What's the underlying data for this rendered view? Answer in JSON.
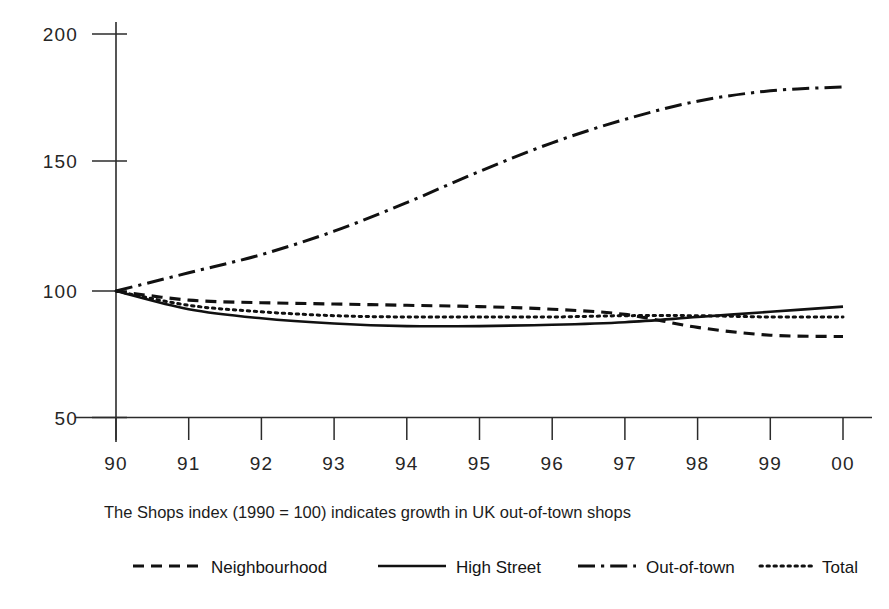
{
  "chart_data": {
    "type": "line",
    "title": "",
    "subtitle": "",
    "caption": "The Shops index (1990 = 100) indicates growth in UK out-of-town shops",
    "xlabel": "",
    "ylabel": "",
    "x": [
      "90",
      "91",
      "92",
      "93",
      "94",
      "95",
      "96",
      "97",
      "98",
      "99",
      "00"
    ],
    "x_values": [
      1990,
      1991,
      1992,
      1993,
      1994,
      1995,
      1996,
      1997,
      1998,
      1999,
      2000
    ],
    "xtick_labels": [
      "90",
      "91",
      "92",
      "93",
      "94",
      "95",
      "96",
      "97",
      "98",
      "99",
      "00"
    ],
    "ytick_labels": [
      "200",
      "150",
      "100",
      "50"
    ],
    "ytick_values": [
      200,
      150,
      100,
      50
    ],
    "ylim": [
      50,
      200
    ],
    "xlim": [
      1990,
      2000
    ],
    "grid": false,
    "legend_position": "bottom",
    "series": [
      {
        "name": "Neighbourhood",
        "style": "dashed",
        "color": "#111111",
        "values": [
          100,
          96.5,
          95.5,
          95,
          94.5,
          94,
          93,
          91,
          86,
          83,
          82.5
        ]
      },
      {
        "name": "High Street",
        "style": "solid",
        "color": "#111111",
        "values": [
          100,
          93,
          89.5,
          87.5,
          86.5,
          86.5,
          87,
          88,
          90,
          92,
          94
        ]
      },
      {
        "name": "Out-of-town",
        "style": "dash-dot",
        "color": "#111111",
        "values": [
          100,
          107,
          114,
          123,
          134,
          146,
          157,
          166,
          173,
          177,
          178.5
        ]
      },
      {
        "name": "Total",
        "style": "dotted",
        "color": "#111111",
        "values": [
          100,
          94.5,
          92,
          90.5,
          90,
          90,
          90,
          90.5,
          90.5,
          90,
          90
        ]
      }
    ]
  },
  "legend": {
    "items": [
      {
        "label": "Neighbourhood",
        "style": "dashed"
      },
      {
        "label": "High Street",
        "style": "solid"
      },
      {
        "label": "Out-of-town",
        "style": "dash-dot"
      },
      {
        "label": "Total",
        "style": "dotted"
      }
    ]
  },
  "axis": {
    "y_ticks": [
      {
        "label": "200",
        "value": 200
      },
      {
        "label": "150",
        "value": 150
      },
      {
        "label": "100",
        "value": 100
      },
      {
        "label": "50",
        "value": 50
      }
    ],
    "x_ticks": [
      {
        "label": "90"
      },
      {
        "label": "91"
      },
      {
        "label": "92"
      },
      {
        "label": "93"
      },
      {
        "label": "94"
      },
      {
        "label": "95"
      },
      {
        "label": "96"
      },
      {
        "label": "97"
      },
      {
        "label": "98"
      },
      {
        "label": "99"
      },
      {
        "label": "00"
      }
    ]
  },
  "colors": {
    "background": "#ffffff",
    "ink": "#111111",
    "axis": "#2b2b2b",
    "text": "#1c1c1c"
  }
}
